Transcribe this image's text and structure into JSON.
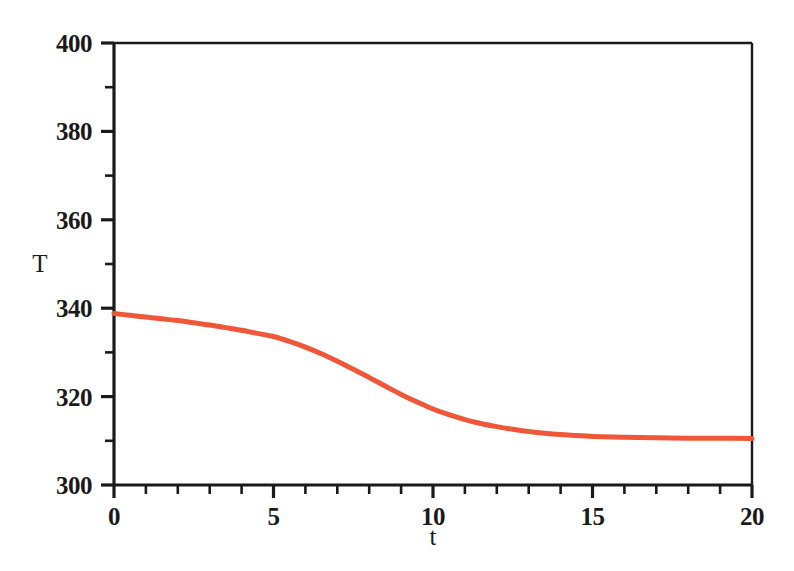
{
  "chart_data": {
    "type": "line",
    "title": "",
    "subtitle": "",
    "xlabel": "t",
    "ylabel": "T",
    "xlim": [
      0,
      20
    ],
    "ylim": [
      300,
      400
    ],
    "grid": false,
    "legend": false,
    "legend_position": "none",
    "x_ticks": [
      0,
      5,
      10,
      15,
      20
    ],
    "x_tick_labels": [
      "0",
      "5",
      "10",
      "15",
      "20"
    ],
    "x_minor_tick_interval": 1,
    "y_ticks": [
      300,
      320,
      340,
      360,
      380,
      400
    ],
    "y_tick_labels": [
      "300",
      "320",
      "340",
      "360",
      "380",
      "400"
    ],
    "y_minor_tick_interval": 10,
    "series": [
      {
        "name": "T(t)",
        "color": "#ef5738",
        "line_width": 5,
        "x": [
          0,
          0.5,
          1,
          1.5,
          2,
          2.5,
          3,
          3.5,
          4,
          4.5,
          5,
          5.5,
          6,
          6.5,
          7,
          7.5,
          8,
          8.5,
          9,
          9.5,
          10,
          10.5,
          11,
          11.5,
          12,
          12.5,
          13,
          13.5,
          14,
          14.5,
          15,
          16,
          17,
          18,
          19,
          20
        ],
        "values": [
          338.8,
          338.4,
          338.0,
          337.6,
          337.2,
          336.7,
          336.2,
          335.6,
          335.0,
          334.3,
          333.6,
          332.5,
          331.2,
          329.7,
          328.0,
          326.2,
          324.3,
          322.4,
          320.5,
          318.8,
          317.2,
          315.9,
          314.8,
          313.9,
          313.2,
          312.6,
          312.1,
          311.7,
          311.4,
          311.2,
          311.0,
          310.8,
          310.7,
          310.6,
          310.6,
          310.5
        ]
      }
    ],
    "annotations": [],
    "asymptote_value": 310.5,
    "initial_value": 338.8
  },
  "axes": {
    "y_label": "T",
    "x_label": "t",
    "frame_color": "#1a1a1a",
    "background": "#ffffff"
  }
}
